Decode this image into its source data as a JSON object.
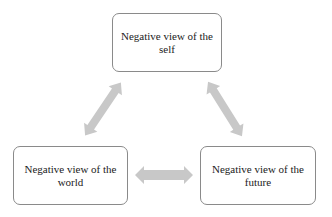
{
  "diagram": {
    "nodes": [
      {
        "id": "self",
        "label": "Negative view of the self"
      },
      {
        "id": "world",
        "label": "Negative view of the world"
      },
      {
        "id": "future",
        "label": "Negative view of the future"
      }
    ],
    "edges": [
      {
        "from": "self",
        "to": "world",
        "type": "bidirectional"
      },
      {
        "from": "self",
        "to": "future",
        "type": "bidirectional"
      },
      {
        "from": "world",
        "to": "future",
        "type": "bidirectional"
      }
    ],
    "colors": {
      "arrow": "#c8c8c8",
      "border": "#8a8a8a",
      "text": "#222222"
    }
  }
}
